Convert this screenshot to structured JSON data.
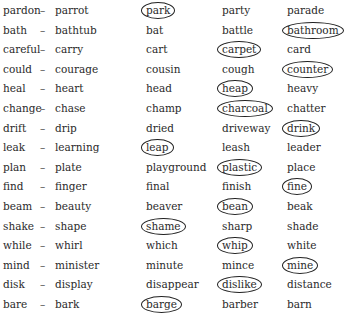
{
  "worksheet": {
    "rows": [
      {
        "base": "pardon",
        "dash": "–",
        "pair": "parrot",
        "options": [
          {
            "word": "park",
            "circled": true
          },
          {
            "word": "party",
            "circled": false
          },
          {
            "word": "parade",
            "circled": false
          }
        ]
      },
      {
        "base": "bath",
        "dash": "–",
        "pair": "bathtub",
        "options": [
          {
            "word": "bat",
            "circled": false
          },
          {
            "word": "battle",
            "circled": false
          },
          {
            "word": "bathroom",
            "circled": true
          }
        ]
      },
      {
        "base": "careful",
        "dash": "–",
        "pair": "carry",
        "options": [
          {
            "word": "cart",
            "circled": false
          },
          {
            "word": "carpet",
            "circled": true
          },
          {
            "word": "card",
            "circled": false
          }
        ]
      },
      {
        "base": "could",
        "dash": "–",
        "pair": "courage",
        "options": [
          {
            "word": "cousin",
            "circled": false
          },
          {
            "word": "cough",
            "circled": false
          },
          {
            "word": "counter",
            "circled": true
          }
        ]
      },
      {
        "base": "heal",
        "dash": "–",
        "pair": "heart",
        "options": [
          {
            "word": "head",
            "circled": false
          },
          {
            "word": "heap",
            "circled": true
          },
          {
            "word": "heavy",
            "circled": false
          }
        ]
      },
      {
        "base": "change",
        "dash": "–",
        "pair": "chase",
        "options": [
          {
            "word": "champ",
            "circled": false
          },
          {
            "word": "charcoal",
            "circled": true
          },
          {
            "word": "chatter",
            "circled": false
          }
        ]
      },
      {
        "base": "drift",
        "dash": "–",
        "pair": "drip",
        "options": [
          {
            "word": "dried",
            "circled": false
          },
          {
            "word": "driveway",
            "circled": false
          },
          {
            "word": "drink",
            "circled": true
          }
        ]
      },
      {
        "base": "leak",
        "dash": "–",
        "pair": "learning",
        "options": [
          {
            "word": "leap",
            "circled": true
          },
          {
            "word": "leash",
            "circled": false
          },
          {
            "word": "leader",
            "circled": false
          }
        ]
      },
      {
        "base": "plan",
        "dash": "–",
        "pair": "plate",
        "options": [
          {
            "word": "playground",
            "circled": false
          },
          {
            "word": "plastic",
            "circled": true
          },
          {
            "word": "place",
            "circled": false
          }
        ]
      },
      {
        "base": "find",
        "dash": "–",
        "pair": "finger",
        "options": [
          {
            "word": "final",
            "circled": false
          },
          {
            "word": "finish",
            "circled": false
          },
          {
            "word": "fine",
            "circled": true
          }
        ]
      },
      {
        "base": "beam",
        "dash": "–",
        "pair": "beauty",
        "options": [
          {
            "word": "beaver",
            "circled": false
          },
          {
            "word": "bean",
            "circled": true
          },
          {
            "word": "beak",
            "circled": false
          }
        ]
      },
      {
        "base": "shake",
        "dash": "–",
        "pair": "shape",
        "options": [
          {
            "word": "shame",
            "circled": true
          },
          {
            "word": "sharp",
            "circled": false
          },
          {
            "word": "shade",
            "circled": false
          }
        ]
      },
      {
        "base": "while",
        "dash": "–",
        "pair": "whirl",
        "options": [
          {
            "word": "which",
            "circled": false
          },
          {
            "word": "whip",
            "circled": true
          },
          {
            "word": "white",
            "circled": false
          }
        ]
      },
      {
        "base": "mind",
        "dash": "–",
        "pair": "minister",
        "options": [
          {
            "word": "minute",
            "circled": false
          },
          {
            "word": "mince",
            "circled": false
          },
          {
            "word": "mine",
            "circled": true
          }
        ]
      },
      {
        "base": "disk",
        "dash": "–",
        "pair": "display",
        "options": [
          {
            "word": "disappear",
            "circled": false
          },
          {
            "word": "dislike",
            "circled": true
          },
          {
            "word": "distance",
            "circled": false
          }
        ]
      },
      {
        "base": "bare",
        "dash": "–",
        "pair": "bark",
        "options": [
          {
            "word": "barge",
            "circled": true
          },
          {
            "word": "barber",
            "circled": false
          },
          {
            "word": "barn",
            "circled": false
          }
        ]
      }
    ]
  }
}
